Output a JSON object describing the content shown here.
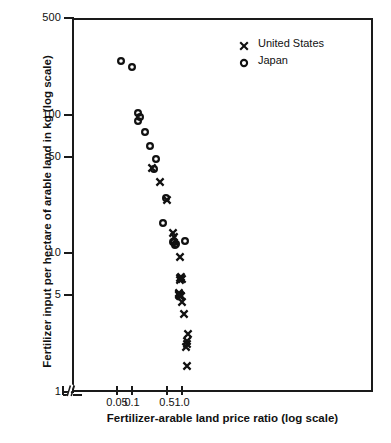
{
  "chart_data": {
    "type": "scatter",
    "title": "",
    "xlabel": "Fertilizer-arable land price ratio (log scale)",
    "ylabel": "Fertilizer input per hectare of arable land in kg (log scale)",
    "xscale": "log",
    "yscale": "log",
    "xlim": [
      0.035,
      1.45
    ],
    "ylim": [
      1,
      500
    ],
    "grid": false,
    "axis_break_x": true,
    "legend_position": "top-right",
    "xticks": [
      0.05,
      0.1,
      0.5,
      1.0
    ],
    "xtick_labels": [
      "0.05",
      "0.1",
      "0.5",
      "1.0"
    ],
    "yticks": [
      1,
      5,
      10,
      50,
      100,
      500
    ],
    "ytick_labels": [
      "1",
      "5",
      "10",
      "50",
      "100",
      "500"
    ],
    "series": [
      {
        "name": "United States",
        "marker": "x",
        "color": "#111111",
        "points": [
          [
            0.232,
            43.0
          ],
          [
            0.333,
            34.0
          ],
          [
            0.455,
            25.0
          ],
          [
            0.6,
            14.5
          ],
          [
            0.62,
            13.6
          ],
          [
            0.84,
            9.8
          ],
          [
            0.83,
            6.9
          ],
          [
            0.845,
            6.6
          ],
          [
            0.88,
            7.0
          ],
          [
            0.895,
            6.8
          ],
          [
            0.775,
            5.4
          ],
          [
            0.79,
            5.3
          ],
          [
            0.805,
            5.2
          ],
          [
            0.82,
            5.2
          ],
          [
            0.835,
            5.1
          ],
          [
            0.85,
            5.1
          ],
          [
            0.87,
            5.1
          ],
          [
            0.93,
            4.6
          ],
          [
            1.02,
            3.8
          ],
          [
            1.12,
            2.3
          ],
          [
            1.135,
            2.4
          ],
          [
            1.105,
            2.2
          ],
          [
            1.21,
            2.7
          ],
          [
            1.13,
            1.6
          ]
        ]
      },
      {
        "name": "Japan",
        "marker": "o",
        "color": "#111111",
        "points": [
          [
            0.056,
            255.0
          ],
          [
            0.093,
            230.0
          ],
          [
            0.12,
            106.0
          ],
          [
            0.118,
            94.0
          ],
          [
            0.131,
            99.0
          ],
          [
            0.165,
            78.0
          ],
          [
            0.205,
            62.0
          ],
          [
            0.27,
            50.0
          ],
          [
            0.248,
            42.0
          ],
          [
            0.372,
            17.0
          ],
          [
            0.44,
            26.0
          ],
          [
            0.61,
            12.6
          ],
          [
            0.625,
            12.6
          ],
          [
            0.648,
            11.9
          ],
          [
            0.7,
            12.0
          ],
          [
            1.04,
            12.8
          ]
        ]
      }
    ]
  },
  "legend": {
    "items": [
      {
        "label": "United States",
        "marker": "x"
      },
      {
        "label": "Japan",
        "marker": "o"
      }
    ]
  },
  "source_caption": ""
}
